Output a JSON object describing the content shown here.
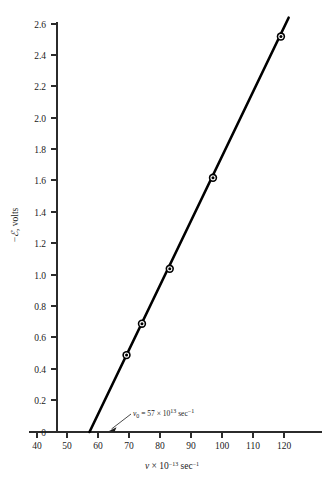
{
  "chart_data": {
    "type": "scatter",
    "title": "",
    "subtitle": "",
    "xlabel": "v × 10⁻¹³ sec⁻¹",
    "xlabel_parts": {
      "symbol": "v",
      "times": "×",
      "mantissa": "10",
      "exponent": "−13",
      "unit": "sec",
      "unit_exponent": "−1"
    },
    "ylabel": "−ℰ, volts",
    "ylabel_parts": {
      "minus": "−",
      "symbol": "ℰ",
      "rest": ", volts"
    },
    "xlim": [
      40,
      127
    ],
    "ylim": [
      0,
      2.62
    ],
    "xticks": [
      40,
      50,
      60,
      70,
      80,
      90,
      100,
      110,
      120
    ],
    "xtick_labels": [
      "40",
      "50",
      "60",
      "70",
      "80",
      "90",
      "100",
      "110",
      "120"
    ],
    "yticks": [
      0,
      0.2,
      0.4,
      0.6,
      0.8,
      1.0,
      1.2,
      1.4,
      1.6,
      1.8,
      2.0,
      2.2,
      2.4,
      2.6
    ],
    "ytick_labels": [
      "0",
      "0.2",
      "0.4",
      "0.6",
      "0.8",
      "1.0",
      "1.2",
      "1.4",
      "1.6",
      "1.8",
      "2.0",
      "2.2",
      "2.4",
      "2.6"
    ],
    "grid": false,
    "legend": "none",
    "series": [
      {
        "name": "stopping voltage vs frequency",
        "marker": "circle-bullseye",
        "color": "#000000",
        "x": [
          69.0,
          74.0,
          83.0,
          97.0,
          119.0
        ],
        "y": [
          0.49,
          0.69,
          1.04,
          1.62,
          2.52
        ]
      }
    ],
    "fit_line": {
      "name": "least-squares line",
      "color": "#000000",
      "x_start": 57.0,
      "y_start": 0.0,
      "x_end": 121.5,
      "y_end": 2.64,
      "x_intercept": 57.0,
      "slope": 0.04093
    },
    "annotations": [
      {
        "name": "threshold-frequency-annotation",
        "text": "v₀ = 57 × 10¹³ sec⁻¹",
        "parts": {
          "symbol": "v",
          "subscript": "0",
          "equals": "=",
          "value": "57",
          "times": "×",
          "mantissa": "10",
          "exponent": "13",
          "unit": "sec",
          "unit_exponent": "−1"
        },
        "points_to_x": 57.0,
        "points_to_y": 0.0
      }
    ]
  }
}
